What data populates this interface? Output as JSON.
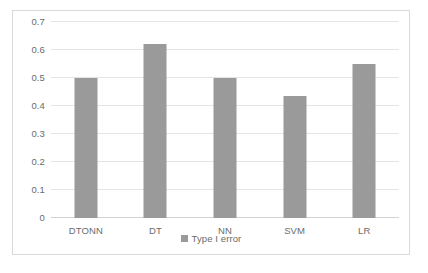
{
  "chart_data": {
    "type": "bar",
    "title": "",
    "subtitle": "",
    "xlabel": "",
    "ylabel": "",
    "categories": [
      "DTONN",
      "DT",
      "NN",
      "SVM",
      "LR"
    ],
    "series": [
      {
        "name": "Type I error",
        "values": [
          0.5,
          0.62,
          0.5,
          0.435,
          0.55
        ],
        "color": "#9a9a9a"
      }
    ],
    "ylim": [
      0,
      0.7
    ],
    "ytick_labels": [
      "0",
      "0.1",
      "0.2",
      "0.3",
      "0.4",
      "0.5",
      "0.6",
      "0.7"
    ],
    "ytick_values": [
      0,
      0.1,
      0.2,
      0.3,
      0.4,
      0.5,
      0.6,
      0.7
    ],
    "grid": true,
    "grid_axis": "y",
    "legend": {
      "position": "bottom-center",
      "entries": [
        {
          "label": "Type I error",
          "color": "#9a9a9a"
        }
      ]
    },
    "colors": {
      "bar": "#9a9a9a",
      "gridline": "#e4e4e4",
      "baseline": "#d2d2d2",
      "frame_border": "#d9d9d9",
      "tick_text": "#6b6b6b",
      "background": "#ffffff"
    }
  }
}
